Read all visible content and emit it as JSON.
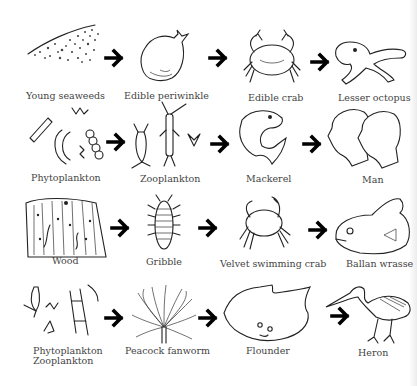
{
  "chains": [
    {
      "row": 1,
      "organisms": [
        {
          "label": "Young seaweeds",
          "icon": "seaweed-illustration"
        },
        {
          "label": "Edible periwinkle",
          "icon": "periwinkle-illustration"
        },
        {
          "label": "Edible crab",
          "icon": "crab-illustration"
        },
        {
          "label": "Lesser octopus",
          "icon": "octopus-illustration"
        }
      ]
    },
    {
      "row": 2,
      "organisms": [
        {
          "label": "Phytoplankton",
          "icon": "phytoplankton-illustration"
        },
        {
          "label": "Zooplankton",
          "icon": "zooplankton-illustration"
        },
        {
          "label": "Mackerel",
          "icon": "mackerel-illustration"
        },
        {
          "label": "Man",
          "icon": "human-heads-illustration"
        }
      ]
    },
    {
      "row": 3,
      "organisms": [
        {
          "label": "Wood",
          "icon": "wood-illustration"
        },
        {
          "label": "Gribble",
          "icon": "gribble-illustration"
        },
        {
          "label": "Velvet swimming crab",
          "icon": "velvet-crab-illustration"
        },
        {
          "label": "Ballan wrasse",
          "icon": "wrasse-illustration"
        }
      ]
    },
    {
      "row": 4,
      "organisms": [
        {
          "label": "Phytoplankton",
          "label2": "Zooplankton",
          "icon": "plankton-illustration"
        },
        {
          "label": "Peacock fanworm",
          "icon": "fanworm-illustration"
        },
        {
          "label": "Flounder",
          "icon": "flounder-illustration"
        },
        {
          "label": "Heron",
          "icon": "heron-illustration"
        }
      ]
    }
  ],
  "arrow_icon": "right-arrow-icon",
  "colors": {
    "ink": "#222222",
    "label": "#444444",
    "background": "#ffffff"
  }
}
